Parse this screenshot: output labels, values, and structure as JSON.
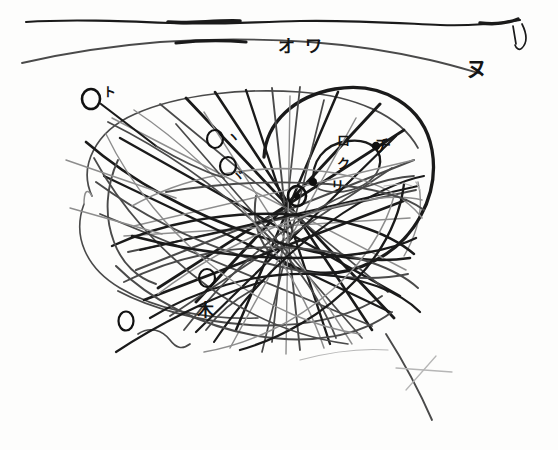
{
  "image": {
    "title": "Hand-drawn particle track sketch",
    "media": "pencil and ink on paper (scanned)",
    "width": 558,
    "height": 450,
    "background_color": "#fdfdfc",
    "ink_color": "#1a1a1a"
  },
  "palette": {
    "ink_dark": "#1a1a1a",
    "ink_mid": "#4a4a4a",
    "ink_light": "#8d8d8d",
    "ink_faint": "#b6b6b6",
    "paper": "#fdfdfc"
  },
  "annotations": {
    "top_labels": [
      {
        "id": "label-o",
        "text": "オ",
        "x": 278,
        "y": 52
      },
      {
        "id": "label-wa",
        "text": "ワ",
        "x": 305,
        "y": 52
      },
      {
        "id": "label-nu",
        "text": "ヌ",
        "x": 466,
        "y": 76
      },
      {
        "id": "label-ru",
        "text": "ル",
        "x": 516,
        "y": 33
      }
    ],
    "circled_labels": [
      {
        "id": "circle-to",
        "text": "ト",
        "cx": 91,
        "cy": 99,
        "r": 9,
        "label_x": 103,
        "label_y": 96
      },
      {
        "id": "circle-ii",
        "text": "ヽ",
        "cx": 215,
        "cy": 139,
        "r": 8,
        "label_x": 227,
        "label_y": 141
      },
      {
        "id": "circle-ji",
        "text": "ヾ",
        "cx": 228,
        "cy": 166,
        "r": 8,
        "label_x": 232,
        "label_y": 180
      },
      {
        "id": "circle-center",
        "text": "",
        "cx": 297,
        "cy": 196,
        "r": 9,
        "label_x": 0,
        "label_y": 0
      },
      {
        "id": "circle-lower",
        "text": "",
        "cx": 207,
        "cy": 278,
        "r": 8,
        "label_x": 0,
        "label_y": 0
      },
      {
        "id": "circle-bottom-left",
        "text": "",
        "cx": 126,
        "cy": 321,
        "r": 8,
        "label_x": 0,
        "label_y": 0
      }
    ],
    "inner_labels": [
      {
        "id": "label-ro",
        "text": "ロ",
        "x": 337,
        "y": 145
      },
      {
        "id": "label-ku",
        "text": "ク",
        "x": 337,
        "y": 168
      },
      {
        "id": "label-ri",
        "text": "リ",
        "x": 331,
        "y": 184
      },
      {
        "id": "label-chi",
        "text": "チ",
        "x": 374,
        "y": 147
      }
    ],
    "symbols": [
      {
        "id": "asterisk-ki",
        "text": "木",
        "x": 203,
        "y": 314
      },
      {
        "id": "faint-cross",
        "x": 418,
        "y": 375
      }
    ],
    "illegible_scribble": {
      "id": "faint-scribble",
      "x": 398,
      "y": 188,
      "note": "illegible faint writing"
    }
  },
  "structures": {
    "horizon_lines": 2,
    "main_ellipse": {
      "cx": 300,
      "cy": 225,
      "rx": 150,
      "ry": 115
    },
    "dark_arc_circle": {
      "cx": 348,
      "cy": 170,
      "r": 86
    },
    "inner_loop": {
      "cx": 347,
      "cy": 163,
      "rx": 34,
      "ry": 24
    },
    "straight_tracks": 26,
    "curved_tracks": 18,
    "vertices": [
      {
        "id": "vertex-main",
        "x": 297,
        "y": 196
      },
      {
        "id": "vertex-right",
        "x": 376,
        "y": 146
      },
      {
        "id": "vertex-inner",
        "x": 313,
        "y": 182
      },
      {
        "id": "vertex-lower",
        "x": 245,
        "y": 272
      }
    ]
  }
}
